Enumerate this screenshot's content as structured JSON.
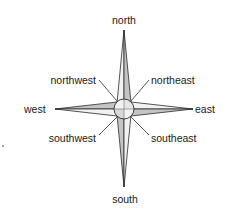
{
  "diagram": {
    "colors": {
      "line": "#2a2a2a",
      "shade": "#c4c4c4",
      "light": "#f2f2f2",
      "text": "#1a1a1a"
    },
    "labels": {
      "north": "north",
      "south": "south",
      "east": "east",
      "west": "west",
      "northeast": "northeast",
      "northwest": "northwest",
      "southeast": "southeast",
      "southwest": "southwest"
    }
  }
}
